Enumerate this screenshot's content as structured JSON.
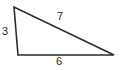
{
  "figure": {
    "kind": "triangle-diagram",
    "background_color": "#ffffff",
    "stroke_color": "#2b2b2b",
    "stroke_width": 1.6,
    "vertices": {
      "apex": {
        "x": 14,
        "y": 7
      },
      "bottom_left": {
        "x": 18,
        "y": 55
      },
      "bottom_right": {
        "x": 114,
        "y": 55
      }
    },
    "sides": [
      {
        "name": "left-side",
        "label": "3",
        "from": "apex",
        "to": "bottom_left"
      },
      {
        "name": "hypotenuse",
        "label": "7",
        "from": "apex",
        "to": "bottom_right"
      },
      {
        "name": "base",
        "label": "6",
        "from": "bottom_left",
        "to": "bottom_right"
      }
    ],
    "labels": {
      "left": "3",
      "hypotenuse": "7",
      "base": "6"
    }
  }
}
